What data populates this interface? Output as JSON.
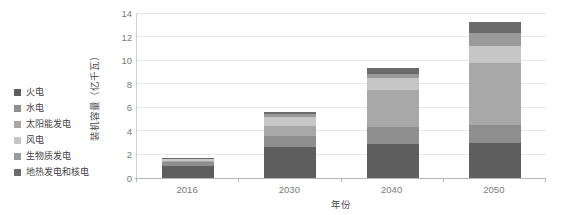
{
  "chart_data": {
    "type": "bar",
    "stacked": true,
    "title": "",
    "subtitle": "",
    "xlabel": "年份",
    "ylabel": "装机容量（亿千瓦）",
    "categories": [
      "2016",
      "2030",
      "2040",
      "2050"
    ],
    "ylim": [
      0,
      14
    ],
    "yticks": [
      0,
      2,
      4,
      6,
      8,
      10,
      12,
      14
    ],
    "ytick_labels": [
      "0",
      "2",
      "4",
      "6",
      "8",
      "10",
      "12",
      "14"
    ],
    "grid": true,
    "legend_position": "left-outside",
    "series": [
      {
        "name": "火电",
        "color": "#5e5e5e",
        "values": [
          1.06,
          2.6,
          2.9,
          2.95
        ]
      },
      {
        "name": "水电",
        "color": "#8e8e8e",
        "values": [
          0.33,
          0.95,
          1.4,
          1.55
        ]
      },
      {
        "name": "太阳能发电",
        "color": "#a8a8a8",
        "values": [
          0.08,
          0.9,
          3.2,
          5.3
        ]
      },
      {
        "name": "风电",
        "color": "#c6c6c6",
        "values": [
          0.15,
          0.75,
          1.0,
          1.4
        ]
      },
      {
        "name": "生物质发电",
        "color": "#9a9a9a",
        "values": [
          0.02,
          0.2,
          0.3,
          1.1
        ]
      },
      {
        "name": "地热发电和核电",
        "color": "#6b6b6b",
        "values": [
          0.04,
          0.2,
          0.5,
          0.9
        ]
      }
    ],
    "totals": [
      1.68,
      5.6,
      9.3,
      13.2
    ],
    "annotations": []
  },
  "legend": {
    "items": [
      {
        "label": "火电"
      },
      {
        "label": "水电"
      },
      {
        "label": "太阳能发电"
      },
      {
        "label": "风电"
      },
      {
        "label": "生物质发电"
      },
      {
        "label": "地热发电和核电"
      }
    ]
  },
  "axes": {
    "y_title": "装机容量（亿千瓦）",
    "x_title": "年份"
  },
  "colors": {
    "grid": "#e8e8e8",
    "axis": "#b5b5b5",
    "tick_text": "#7a7a7a",
    "background": "#ffffff"
  }
}
